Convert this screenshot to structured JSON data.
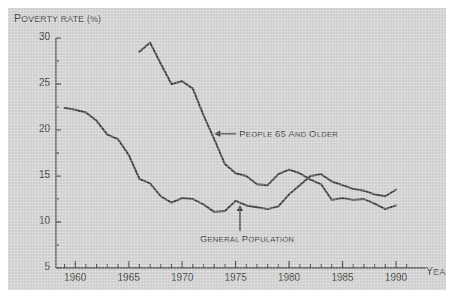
{
  "chart_data": {
    "type": "line",
    "title": "",
    "xlabel": "YEAR",
    "ylabel": "POVERTY RATE (%)",
    "xlim": [
      1958.2,
      1991.5
    ],
    "ylim": [
      5,
      30
    ],
    "yticks": [
      5,
      10,
      15,
      20,
      25,
      30
    ],
    "xticks": [
      1960,
      1965,
      1970,
      1975,
      1980,
      1985,
      1990
    ],
    "xtick_labels": [
      "1960",
      "1965",
      "1970",
      "1975",
      "1980",
      "1985",
      "1990"
    ],
    "ytick_labels": [
      "5",
      "10",
      "15",
      "20",
      "25",
      "30"
    ],
    "minor_xticks": true,
    "grid": false,
    "legend": "annotations",
    "line_color": "#3d3d3d",
    "background_color": "#cfcfcf",
    "page_color": "#ffffff",
    "series": [
      {
        "name": "People 65 and older",
        "x": [
          1966,
          1967,
          1968,
          1969,
          1970,
          1971,
          1972,
          1973,
          1974,
          1975,
          1976,
          1977,
          1978,
          1979,
          1980,
          1981,
          1982,
          1983,
          1984,
          1985,
          1986,
          1987,
          1988,
          1989,
          1990
        ],
        "values": [
          28.5,
          29.5,
          27.2,
          25.0,
          25.3,
          24.5,
          21.6,
          19.0,
          16.3,
          15.3,
          15.0,
          14.1,
          14.0,
          15.2,
          15.7,
          15.3,
          14.6,
          14.1,
          12.4,
          12.6,
          12.4,
          12.5,
          12.0,
          11.4,
          11.8
        ]
      },
      {
        "name": "General population",
        "x": [
          1959,
          1960,
          1961,
          1962,
          1963,
          1964,
          1965,
          1966,
          1967,
          1968,
          1969,
          1970,
          1971,
          1972,
          1973,
          1974,
          1975,
          1976,
          1977,
          1978,
          1979,
          1980,
          1981,
          1982,
          1983,
          1984,
          1985,
          1986,
          1987,
          1988,
          1989,
          1990
        ],
        "values": [
          22.4,
          22.2,
          21.9,
          21.0,
          19.5,
          19.0,
          17.3,
          14.7,
          14.2,
          12.8,
          12.1,
          12.6,
          12.5,
          11.9,
          11.1,
          11.2,
          12.3,
          11.8,
          11.6,
          11.4,
          11.7,
          13.0,
          14.0,
          15.0,
          15.2,
          14.4,
          14.0,
          13.6,
          13.4,
          13.0,
          12.8,
          13.5
        ]
      }
    ],
    "annotations": [
      {
        "name": "elderly-series-annotation",
        "text_small_caps_lead": "P",
        "text": "EOPLE ",
        "text_number": "65 ",
        "text_tail": "AND OLDER",
        "full_text": "PEOPLE 65 AND OLDER",
        "arrow": "left"
      },
      {
        "name": "general-population-annotation",
        "full_text": "GENERAL POPULATION",
        "arrow": "up"
      }
    ]
  },
  "labels": {
    "y_axis_title_lead": "P",
    "y_axis_title_rest": "OVERTY RATE (%)",
    "x_axis_title_lead": "Y",
    "x_axis_title_rest": "EAR"
  }
}
